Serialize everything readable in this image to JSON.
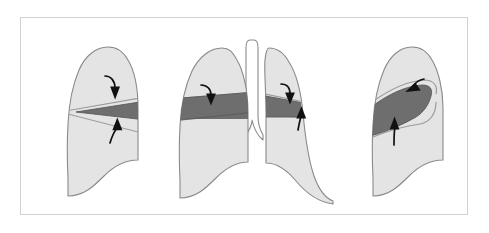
{
  "figure": {
    "caption": "",
    "width": 489,
    "height": 233,
    "background_color": "#ffffff"
  },
  "frame": {
    "name": "figure-border",
    "x": 20,
    "y": 17,
    "width": 448,
    "height": 198,
    "stroke_color": "#d2d2d2",
    "stroke_width": 1,
    "fill_color": "#ffffff"
  },
  "colors": {
    "lung_fill": "#e4e4e4",
    "lung_outline": "#8a8a8a",
    "collapse_fill": "#6e6e6e",
    "collapse_outline": "#5a5a5a",
    "fissure_line": "#9a9a9a",
    "arrow_color": "#111111",
    "trachea_fill": "#ffffff",
    "frame_stroke": "#d2d2d2"
  },
  "panels": [
    {
      "id": "panel-left-lateral",
      "label": "Lateral view — right lung",
      "position": "left",
      "lung_count": 1,
      "collapse_shape": "horizontal-wedge",
      "collapse_label": "collapsed lobe band",
      "arrows": [
        {
          "name": "arrow-superior",
          "direction": "down",
          "label": "fissure displaced downward"
        },
        {
          "name": "arrow-inferior",
          "direction": "up",
          "label": "fissure displaced upward"
        }
      ]
    },
    {
      "id": "panel-frontal",
      "label": "Frontal view — both lungs with trachea",
      "position": "center",
      "lung_count": 2,
      "collapse_shape": "horizontal-band",
      "collapse_label": "collapsed lobe band",
      "arrows": [
        {
          "name": "arrow-left-lung-down",
          "direction": "down",
          "label": "fissure displaced downward"
        },
        {
          "name": "arrow-right-lung-down",
          "direction": "down",
          "label": "fissure displaced downward"
        },
        {
          "name": "arrow-right-lung-up",
          "direction": "up",
          "label": "fissure displaced upward"
        }
      ]
    },
    {
      "id": "panel-right-lateral",
      "label": "Lateral view — left lung",
      "position": "right",
      "lung_count": 1,
      "collapse_shape": "triangular-wedge",
      "collapse_label": "collapsed lobe wedge",
      "arrows": [
        {
          "name": "arrow-superior",
          "direction": "down-left",
          "label": "fissure displaced downward"
        },
        {
          "name": "arrow-inferior",
          "direction": "up",
          "label": "fissure displaced upward"
        }
      ]
    }
  ]
}
